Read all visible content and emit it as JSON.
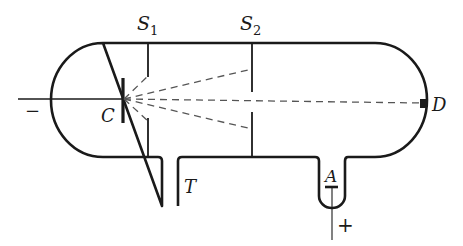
{
  "diagram": {
    "labels": {
      "slit1": "S",
      "slit1_sub": "1",
      "slit2": "S",
      "slit2_sub": "2",
      "cathode": "C",
      "detector": "D",
      "tube": "T",
      "anode": "A",
      "negative": "−",
      "positive": "+"
    },
    "colors": {
      "stroke": "#1a1a1a",
      "dashed": "#555555",
      "background": "#ffffff"
    }
  }
}
